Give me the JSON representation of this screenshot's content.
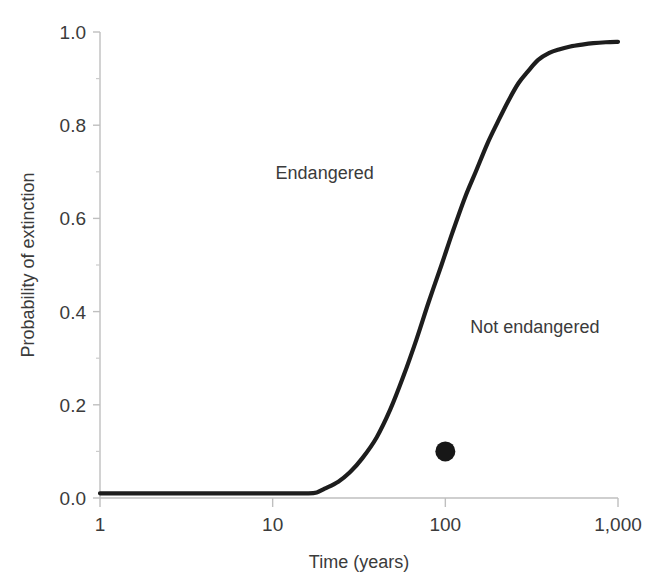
{
  "chart_data": {
    "type": "line",
    "title": "",
    "xlabel": "Time (years)",
    "ylabel": "Probability of extinction",
    "xscale": "log",
    "xlim": [
      1,
      1000
    ],
    "ylim": [
      0.0,
      1.0
    ],
    "grid": false,
    "legend": "none",
    "x_tick_labels": [
      "1",
      "10",
      "100",
      "1,000"
    ],
    "x_tick_values": [
      1,
      10,
      100,
      1000
    ],
    "y_tick_labels": [
      "0.0",
      "0.2",
      "0.4",
      "0.6",
      "0.8",
      "1.0"
    ],
    "y_tick_values": [
      0.0,
      0.2,
      0.4,
      0.6,
      0.8,
      1.0
    ],
    "y_minor_tick_values": [
      0.1,
      0.3,
      0.5,
      0.7,
      0.9
    ],
    "series": [
      {
        "name": "extinction-probability-curve",
        "color": "#1d1d1d",
        "x": [
          1,
          2,
          3,
          5,
          8,
          12,
          16,
          18,
          20,
          24,
          28,
          33,
          40,
          48,
          57,
          68,
          80,
          95,
          110,
          130,
          150,
          175,
          200,
          230,
          265,
          300,
          345,
          400,
          460,
          530,
          620,
          720,
          850,
          1000
        ],
        "y": [
          0.01,
          0.01,
          0.01,
          0.01,
          0.01,
          0.01,
          0.01,
          0.012,
          0.02,
          0.035,
          0.055,
          0.085,
          0.13,
          0.19,
          0.26,
          0.34,
          0.42,
          0.5,
          0.57,
          0.645,
          0.7,
          0.76,
          0.805,
          0.85,
          0.89,
          0.915,
          0.94,
          0.955,
          0.963,
          0.969,
          0.973,
          0.976,
          0.978,
          0.979
        ]
      }
    ],
    "points": [
      {
        "name": "observed-population-point",
        "x": 100,
        "y": 0.1,
        "color": "#171717",
        "radius_px": 10
      }
    ],
    "annotations": [
      {
        "name": "endangered-label",
        "text": "Endangered",
        "x": 20,
        "y": 0.685
      },
      {
        "name": "not-endangered-label",
        "text": "Not endangered",
        "x": 330,
        "y": 0.355
      }
    ]
  }
}
